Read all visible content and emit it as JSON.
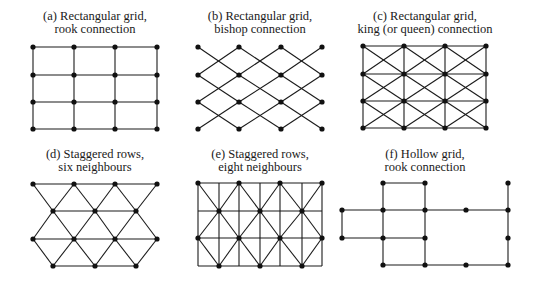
{
  "figure": {
    "colors": {
      "line": "#1a1a1a",
      "node": "#111111",
      "background": "#ffffff"
    },
    "panels": [
      {
        "id": "a",
        "label_lines": [
          "(a) Rectangular grid,",
          "rook connection"
        ],
        "label_x": 95,
        "label_y": [
          20,
          33
        ],
        "type": "rook",
        "xs": [
          33,
          74,
          115,
          157
        ],
        "ys": [
          47,
          75,
          102,
          129
        ]
      },
      {
        "id": "b",
        "label_lines": [
          "(b) Rectangular grid,",
          "bishop connection"
        ],
        "label_x": 260,
        "label_y": [
          20,
          33
        ],
        "type": "bishop",
        "xs": [
          198,
          239,
          281,
          322
        ],
        "ys": [
          47,
          75,
          102,
          129
        ]
      },
      {
        "id": "c",
        "label_lines": [
          "(c) Rectangular grid,",
          "king (or queen) connection"
        ],
        "label_x": 425,
        "label_y": [
          20,
          33
        ],
        "type": "king",
        "xs": [
          363,
          404,
          445,
          486
        ],
        "ys": [
          46,
          74,
          101,
          128
        ]
      },
      {
        "id": "d",
        "label_lines": [
          "(d) Staggered rows,",
          "six neighbours"
        ],
        "label_x": 95,
        "label_y": [
          158,
          171
        ],
        "type": "stagger6",
        "rows": [
          {
            "y": 184,
            "xs": [
              33,
              74,
              115,
              157
            ]
          },
          {
            "y": 211,
            "xs": [
              53,
              95,
              136
            ]
          },
          {
            "y": 239,
            "xs": [
              33,
              74,
              115,
              157
            ]
          },
          {
            "y": 266,
            "xs": [
              53,
              95,
              136
            ]
          }
        ]
      },
      {
        "id": "e",
        "label_lines": [
          "(e) Staggered rows,",
          "eight neighbours"
        ],
        "label_x": 260,
        "label_y": [
          158,
          171
        ],
        "type": "stagger8",
        "rows": [
          {
            "y": 183,
            "xs": [
              198,
              239,
              280,
              322
            ]
          },
          {
            "y": 211,
            "xs": [
              219,
              260,
              302
            ]
          },
          {
            "y": 238,
            "xs": [
              198,
              239,
              280,
              322
            ]
          },
          {
            "y": 266,
            "xs": [
              219,
              260,
              302
            ]
          }
        ],
        "verticals": [
          198,
          219,
          239,
          260,
          280,
          302,
          322
        ]
      },
      {
        "id": "f",
        "label_lines": [
          "(f) Hollow grid,",
          "rook connection"
        ],
        "label_x": 425,
        "label_y": [
          158,
          171
        ],
        "type": "hollow",
        "nodes": [
          [
            383,
            183
          ],
          [
            425,
            183
          ],
          [
            508,
            183
          ],
          [
            342,
            210
          ],
          [
            383,
            210
          ],
          [
            425,
            210
          ],
          [
            466,
            210
          ],
          [
            508,
            210
          ],
          [
            342,
            238
          ],
          [
            383,
            238
          ],
          [
            425,
            238
          ],
          [
            508,
            238
          ],
          [
            383,
            265
          ],
          [
            425,
            265
          ],
          [
            466,
            265
          ],
          [
            508,
            265
          ]
        ],
        "edges": [
          [
            [
              383,
              183
            ],
            [
              425,
              183
            ]
          ],
          [
            [
              342,
              210
            ],
            [
              508,
              210
            ]
          ],
          [
            [
              342,
              238
            ],
            [
              425,
              238
            ]
          ],
          [
            [
              383,
              265
            ],
            [
              508,
              265
            ]
          ],
          [
            [
              342,
              210
            ],
            [
              342,
              238
            ]
          ],
          [
            [
              383,
              183
            ],
            [
              383,
              265
            ]
          ],
          [
            [
              425,
              183
            ],
            [
              425,
              265
            ]
          ],
          [
            [
              508,
              183
            ],
            [
              508,
              265
            ]
          ]
        ]
      }
    ]
  }
}
